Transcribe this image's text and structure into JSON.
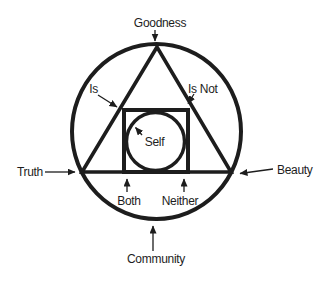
{
  "diagram": {
    "background": "#ffffff",
    "ink_color": "#1d1d1d",
    "shapes": [
      "outer-circle",
      "triangle",
      "square",
      "inner-circle"
    ],
    "center_label": "Self",
    "outer_labels": {
      "top": "Goodness",
      "left": "Truth",
      "right": "Beauty",
      "bottom": "Community"
    },
    "inner_labels": {
      "triangle_left_side": "Is",
      "triangle_right_side": "Is Not",
      "base_left": "Both",
      "base_right": "Neither"
    }
  }
}
